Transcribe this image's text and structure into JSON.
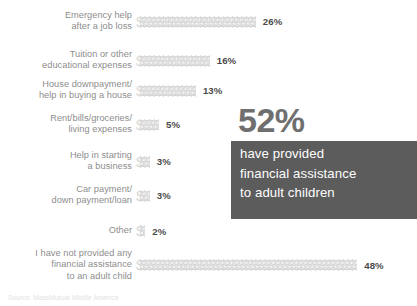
{
  "chart_data": {
    "type": "bar",
    "title": "",
    "subtitle": "",
    "xlabel": "",
    "ylabel": "",
    "grid": false,
    "legend": "none",
    "unit": "%",
    "glyph": "$",
    "glyph_value": 1,
    "orientation": "horizontal",
    "xlim": [
      0,
      48
    ],
    "categories": [
      "Emergency help\nafter a job loss",
      "Tuition or other\neducational expenses",
      "House downpayment/\nhelp in buying a house",
      "Rent/bills/groceries/\nliving expenses",
      "Help in starting\na business",
      "Car payment/\ndown payment/loan",
      "Other",
      "I have not provided any\nfinancial assistance\nto an adult child"
    ],
    "values": [
      26,
      16,
      13,
      5,
      3,
      3,
      2,
      48
    ],
    "value_labels": [
      "26%",
      "16%",
      "13%",
      "5%",
      "3%",
      "3%",
      "2%",
      "48%"
    ],
    "annotations": [
      {
        "stat": "52%",
        "lines": [
          "have provided",
          "financial assistance",
          "to adult children"
        ]
      }
    ]
  },
  "rows": [
    {
      "label": "Emergency help\nafter a job loss",
      "value": 26,
      "value_label": "26%",
      "top": 10
    },
    {
      "label": "Tuition or other\neducational expenses",
      "value": 16,
      "value_label": "16%",
      "top": 49
    },
    {
      "label": "House downpayment/\nhelp in buying a house",
      "value": 13,
      "value_label": "13%",
      "top": 79
    },
    {
      "label": "Rent/bills/groceries/\nliving expenses",
      "value": 5,
      "value_label": "5%",
      "top": 113
    },
    {
      "label": "Help in starting\na business",
      "value": 3,
      "value_label": "3%",
      "top": 150
    },
    {
      "label": "Car payment/\ndown payment/loan",
      "value": 3,
      "value_label": "3%",
      "top": 184
    },
    {
      "label": "Other",
      "value": 2,
      "value_label": "2%",
      "top": 222
    },
    {
      "label": "I have not provided any\nfinancial assistance\nto an adult child",
      "value": 48,
      "value_label": "48%",
      "top": 248
    }
  ],
  "callout": {
    "stat": "52%",
    "line1": "have provided",
    "line2": "financial assistance",
    "line3": "to adult children"
  },
  "source": {
    "text": "Source: MassMutual Middle America"
  },
  "colors": {
    "glyph": "#d6d6d6",
    "label": "#8d8d8d",
    "value": "#4a4a4a",
    "callout_box": "#5c5c5c",
    "callout_stat": "#6f6f6f",
    "callout_text": "#ffffff",
    "background": "#ffffff"
  }
}
